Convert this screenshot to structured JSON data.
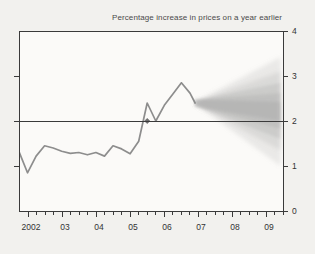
{
  "chart_data": {
    "type": "area",
    "title": "Percentage increase in prices on a year earlier",
    "subtitle": "",
    "xlabel": "",
    "ylabel": "",
    "ylim": [
      0,
      4
    ],
    "yticks": [
      0,
      1,
      2,
      3,
      4
    ],
    "ytick_labels": [
      "0",
      "1",
      "2",
      "3",
      "4"
    ],
    "xlim": [
      2001.75,
      2009.5
    ],
    "xtick_labels": [
      "2002",
      "03",
      "04",
      "05",
      "06",
      "07",
      "08",
      "09"
    ],
    "xticks": [
      2002,
      2003,
      2004,
      2005,
      2006,
      2007,
      2008,
      2009
    ],
    "minor_xtick_interval_quarters": 1,
    "grid": false,
    "legend": null,
    "target_line": {
      "value": 2,
      "label": "inflation target"
    },
    "marker": {
      "x": 2005.5,
      "y": 2.0,
      "shape": "diamond"
    },
    "history": {
      "name": "CPI inflation",
      "x": [
        2001.75,
        2002.0,
        2002.25,
        2002.5,
        2002.75,
        2003.0,
        2003.25,
        2003.5,
        2003.75,
        2004.0,
        2004.25,
        2004.5,
        2004.75,
        2005.0,
        2005.25,
        2005.5,
        2005.75,
        2006.0,
        2006.25,
        2006.5,
        2006.75,
        2006.9
      ],
      "y": [
        1.32,
        0.85,
        1.22,
        1.45,
        1.4,
        1.33,
        1.28,
        1.3,
        1.25,
        1.3,
        1.22,
        1.45,
        1.38,
        1.27,
        1.55,
        2.4,
        2.0,
        2.35,
        2.6,
        2.85,
        2.62,
        2.4
      ]
    },
    "fan": {
      "start_x": 2006.9,
      "end_x": 2009.4,
      "central_start": 2.4,
      "central_end": 2.2,
      "bands": [
        {
          "percentile": 90,
          "start": [
            2.38,
            2.42
          ],
          "end": [
            1.0,
            3.42
          ]
        },
        {
          "percentile": 70,
          "start": [
            2.36,
            2.44
          ],
          "end": [
            1.35,
            3.1
          ]
        },
        {
          "percentile": 50,
          "start": [
            2.34,
            2.46
          ],
          "end": [
            1.6,
            2.85
          ]
        },
        {
          "percentile": 30,
          "start": [
            2.33,
            2.47
          ],
          "end": [
            1.82,
            2.62
          ]
        },
        {
          "percentile": 10,
          "start": [
            2.32,
            2.48
          ],
          "end": [
            2.0,
            2.42
          ]
        }
      ]
    },
    "colors": {
      "background": "#f2f1ee",
      "plot_background": "#fbfaf8",
      "axis": "#3a3a3a",
      "line": "#8a8a8a",
      "fan": "#9a9a9a",
      "text": "#333333"
    }
  }
}
